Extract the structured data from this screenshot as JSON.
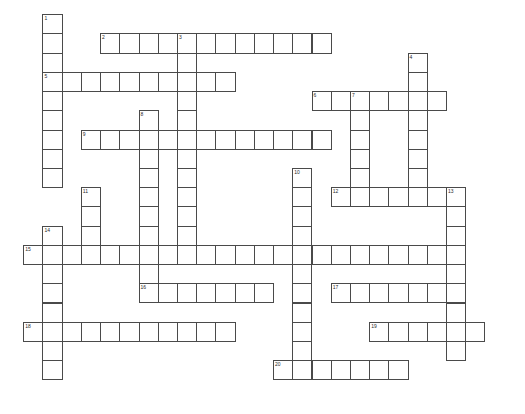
{
  "puzzle": {
    "type": "crossword-grid",
    "title": "Crossword Puzzle Grid",
    "grid": {
      "origin_x": 23.2,
      "origin_y": 14.2,
      "cell_size": 19.22,
      "cols": 26,
      "rows": 21
    },
    "colors": {
      "cell_border": "#4a4a4a",
      "cell_fill": "#ffffff",
      "page_background": "#ffffff",
      "number_text": "#2a2a2a"
    },
    "entries": [
      {
        "number": 1,
        "direction": "down",
        "row": 0,
        "col": 1,
        "length": 9
      },
      {
        "number": 2,
        "direction": "across",
        "row": 1,
        "col": 4,
        "length": 12
      },
      {
        "number": 3,
        "direction": "down",
        "row": 1,
        "col": 8,
        "length": 12
      },
      {
        "number": 4,
        "direction": "down",
        "row": 2,
        "col": 20,
        "length": 7
      },
      {
        "number": 5,
        "direction": "across",
        "row": 3,
        "col": 1,
        "length": 10
      },
      {
        "number": 6,
        "direction": "across",
        "row": 4,
        "col": 15,
        "length": 7
      },
      {
        "number": 7,
        "direction": "down",
        "row": 4,
        "col": 17,
        "length": 6
      },
      {
        "number": 8,
        "direction": "down",
        "row": 5,
        "col": 6,
        "length": 9
      },
      {
        "number": 9,
        "direction": "across",
        "row": 6,
        "col": 3,
        "length": 13
      },
      {
        "number": 10,
        "direction": "down",
        "row": 8,
        "col": 14,
        "length": 11
      },
      {
        "number": 11,
        "direction": "down",
        "row": 9,
        "col": 3,
        "length": 3
      },
      {
        "number": 12,
        "direction": "across",
        "row": 9,
        "col": 16,
        "length": 7
      },
      {
        "number": 13,
        "direction": "down",
        "row": 9,
        "col": 22,
        "length": 9
      },
      {
        "number": 14,
        "direction": "down",
        "row": 11,
        "col": 1,
        "length": 8
      },
      {
        "number": 15,
        "direction": "across",
        "row": 12,
        "col": 0,
        "length": 22
      },
      {
        "number": 16,
        "direction": "across",
        "row": 14,
        "col": 6,
        "length": 7
      },
      {
        "number": 17,
        "direction": "across",
        "row": 14,
        "col": 16,
        "length": 7
      },
      {
        "number": 18,
        "direction": "across",
        "row": 16,
        "col": 0,
        "length": 11
      },
      {
        "number": 19,
        "direction": "across",
        "row": 16,
        "col": 18,
        "length": 6
      },
      {
        "number": 20,
        "direction": "across",
        "row": 18,
        "col": 13,
        "length": 7
      }
    ]
  }
}
